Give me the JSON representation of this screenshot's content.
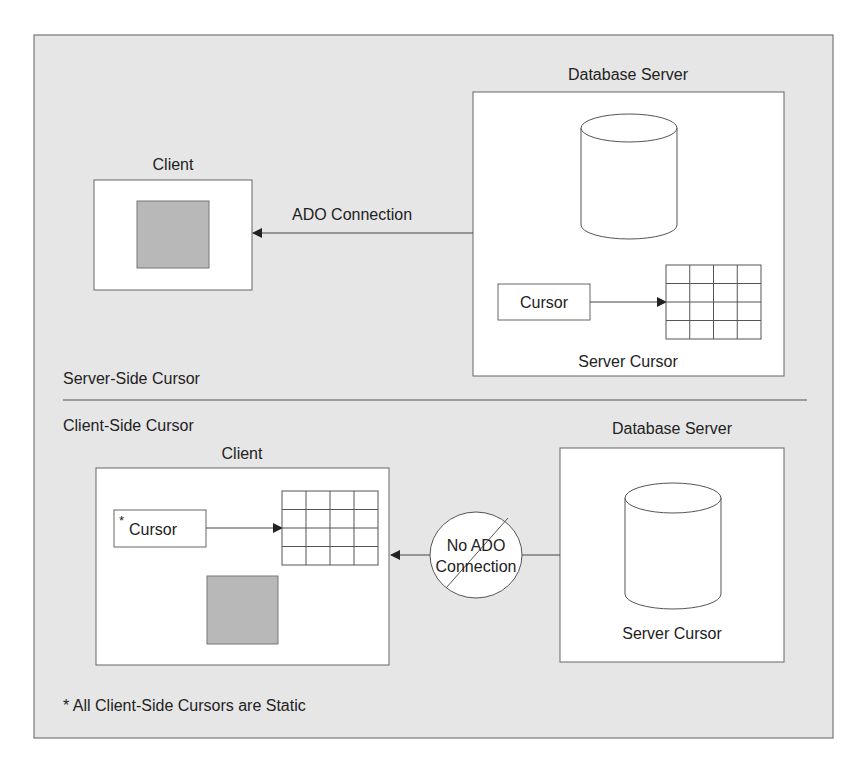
{
  "diagram": {
    "colors": {
      "frame_bg": "#e6e6e6",
      "box_fill": "#ffffff",
      "stroke": "#555555",
      "gray_block": "#b8b8b8",
      "text": "#222222"
    },
    "server_side": {
      "section_label": "Server-Side Cursor",
      "client": {
        "label": "Client"
      },
      "connection": {
        "label": "ADO Connection"
      },
      "database_server": {
        "label": "Database Server",
        "cursor_label": "Cursor",
        "caption": "Server Cursor"
      }
    },
    "client_side": {
      "section_label": "Client-Side Cursor",
      "client": {
        "label": "Client",
        "cursor_marker": "*",
        "cursor_label": "Cursor"
      },
      "connection": {
        "label_line1": "No ADO",
        "label_line2": "Connection"
      },
      "database_server": {
        "label": "Database Server",
        "caption": "Server Cursor"
      }
    },
    "footnote": "* All Client-Side Cursors are Static"
  }
}
